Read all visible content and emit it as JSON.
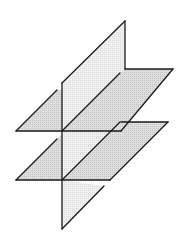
{
  "figure": {
    "colors": {
      "background": "#ffffff",
      "stroke": "#1a1a1a",
      "vertical_plane_fill": "#ececec",
      "horizontal_plane_fill": "#d6d6d6"
    },
    "planes": [
      {
        "name": "vertical-plane",
        "orientation": "vertical"
      },
      {
        "name": "upper-horizontal-plane",
        "orientation": "horizontal"
      },
      {
        "name": "lower-horizontal-plane",
        "orientation": "horizontal"
      }
    ]
  }
}
